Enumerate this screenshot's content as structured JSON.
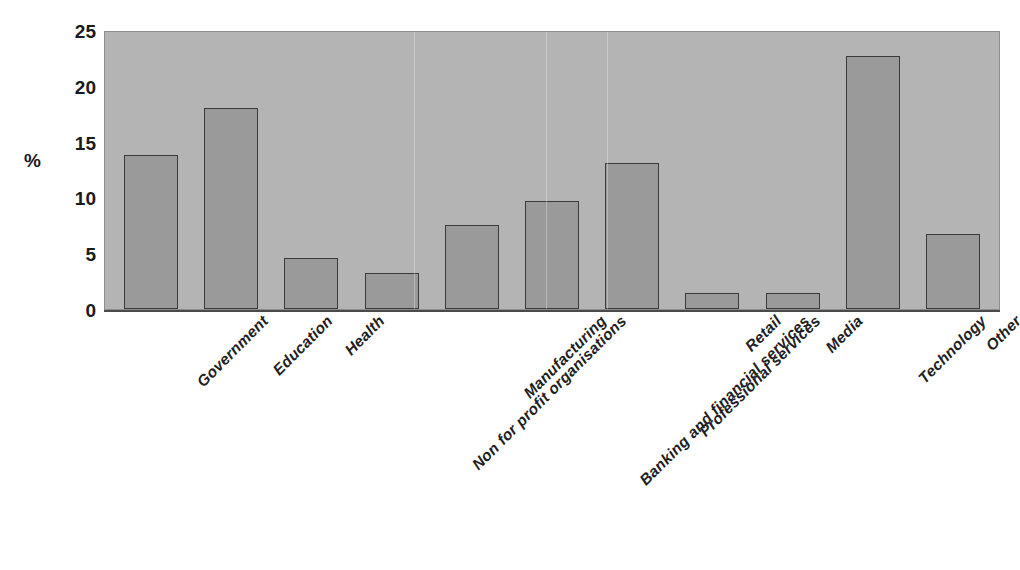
{
  "chart_data": {
    "type": "bar",
    "title": "",
    "subtitle": "",
    "xlabel": "",
    "ylabel": "%",
    "ylim": [
      0,
      25
    ],
    "yticks": [
      0,
      5,
      10,
      15,
      20,
      25
    ],
    "grid": false,
    "legend": null,
    "orientation": "vertical",
    "categories": [
      "Government",
      "Education",
      "Health",
      "Non for profit organisations",
      "Manufacturing",
      "Banking and financial services",
      "Professional services",
      "Retail",
      "Media",
      "Technology",
      "Other"
    ],
    "values": [
      13.8,
      18.0,
      4.6,
      3.2,
      7.5,
      9.7,
      13.1,
      1.4,
      1.4,
      22.7,
      6.7
    ],
    "colors": {
      "bar_fill": "#9a9a9a",
      "bar_edge": "#3a3a3a",
      "plot_background": "#b4b4b4",
      "figure_background": "#ffffff",
      "text": "#1a1a1a"
    }
  }
}
